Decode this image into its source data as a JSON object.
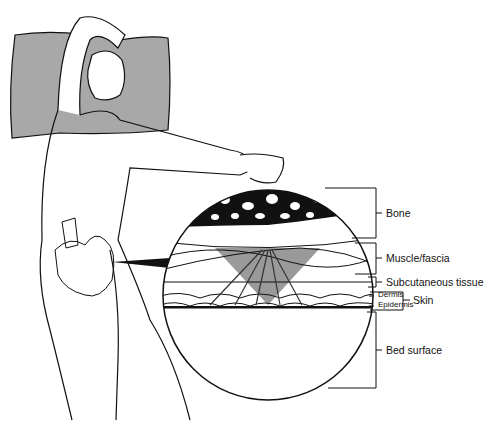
{
  "figure": {
    "labels": {
      "bone": "Bone",
      "muscle": "Muscle/fascia",
      "subcutaneous": "Subcutaneous tissue",
      "dermis": "Dermis",
      "epidermis": "Epidermis",
      "skin": "Skin",
      "bed": "Bed surface"
    },
    "colors": {
      "line": "#111111",
      "pillow": "#a8a8a8",
      "pressure_cone": "#9a9a9a",
      "background": "#ffffff"
    }
  }
}
